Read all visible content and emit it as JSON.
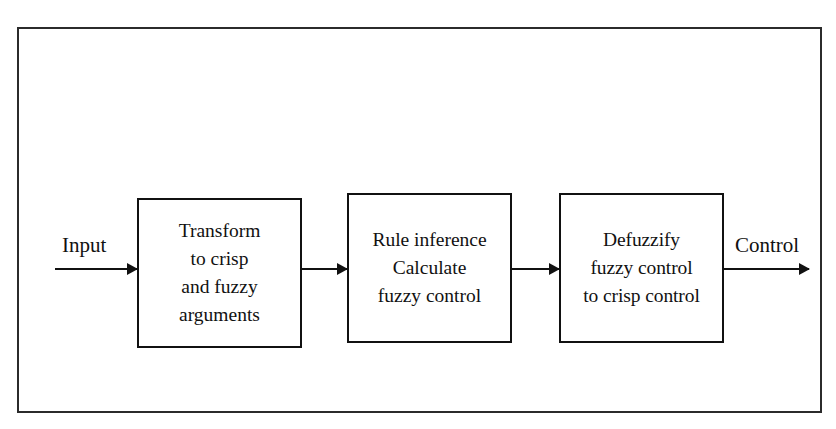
{
  "diagram": {
    "frame": {
      "border_color": "#2b2b2b",
      "background": "#ffffff"
    },
    "box_border_color": "#111111",
    "text_color": "#111111",
    "flow": {
      "input_label": "Input",
      "output_label": "Control"
    },
    "blocks": [
      {
        "id": "transform",
        "lines": [
          "Transform",
          "to crisp",
          "and fuzzy",
          "arguments"
        ]
      },
      {
        "id": "inference",
        "lines": [
          "Rule inference",
          "Calculate",
          "fuzzy control"
        ]
      },
      {
        "id": "defuzzify",
        "lines": [
          "Defuzzify",
          "fuzzy control",
          "to crisp control"
        ]
      }
    ],
    "arrows": [
      {
        "id": "input-arrow",
        "from": "input",
        "to": "transform"
      },
      {
        "id": "transform-to-inference",
        "from": "transform",
        "to": "inference"
      },
      {
        "id": "inference-to-defuzzify",
        "from": "inference",
        "to": "defuzzify"
      },
      {
        "id": "output-arrow",
        "from": "defuzzify",
        "to": "control"
      }
    ]
  }
}
